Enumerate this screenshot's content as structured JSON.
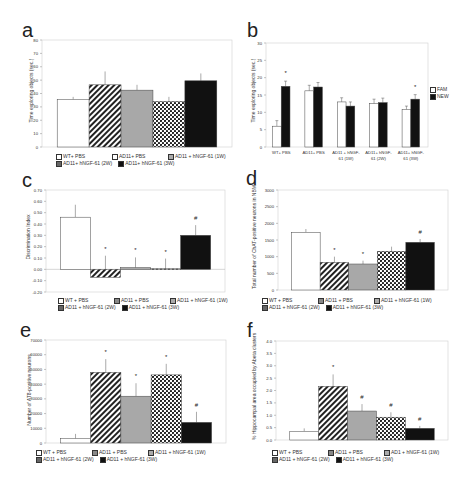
{
  "chart_data": [
    {
      "panel": "a",
      "type": "bar",
      "title": "",
      "xlabel": "",
      "ylabel": "Time exploring objects (sec.)",
      "ylim": [
        0,
        80
      ],
      "yticks": [
        "0",
        "10",
        "20",
        "30",
        "40",
        "50",
        "60",
        "70",
        "80"
      ],
      "categories": [
        "WT+ PBS",
        "AD11+ PBS",
        "AD11 + hNGF-61 (1W)",
        "AD11+ hNGF-61 (2W)",
        "AD11+ hNGF-61 (3W)"
      ],
      "values": [
        35.5,
        46.5,
        42.5,
        34,
        49.5
      ],
      "errors": [
        2,
        10,
        4,
        3.5,
        5.5
      ],
      "annotations": [
        "",
        "",
        "",
        "",
        ""
      ],
      "legend": [
        "WT+ PBS",
        "AD11+ PBS",
        "AD11 + hNGF-61 (1W)",
        "AD11+ hNGF-61 (2W)",
        "AD11+ hNGF-61 (3W)"
      ],
      "legend_position": "bottom",
      "grid": false
    },
    {
      "panel": "b",
      "type": "bar",
      "title": "",
      "xlabel": "",
      "ylabel": "Time exploring objects (sec.)",
      "ylim": [
        0,
        30
      ],
      "yticks": [
        "0",
        "5",
        "10",
        "15",
        "20",
        "25",
        "30"
      ],
      "categories": [
        "WT+ PBS",
        "AD11+ PBS",
        "AD11 + hNGF-61 (1W)",
        "AD11+ hNGF-61 (2W)",
        "AD11+ hNGF-61 (3W)"
      ],
      "category_lines": [
        [
          "WT+ PBS"
        ],
        [
          "AD11+ PBS"
        ],
        [
          "AD11 + hNGF-",
          "61 (1W)"
        ],
        [
          "AD11+ hNGF-",
          "61 (2W)"
        ],
        [
          "AD11+ hNGF-",
          "61 (3W)"
        ]
      ],
      "series": [
        {
          "name": "FAM",
          "values": [
            6,
            16.2,
            13,
            12.5,
            10.8
          ],
          "errors": [
            1.6,
            1.6,
            1.2,
            1.3,
            1
          ],
          "color": "#ffffff"
        },
        {
          "name": "NEW",
          "values": [
            17.5,
            17.3,
            11.8,
            12.8,
            13.8
          ],
          "errors": [
            1.5,
            1.3,
            1.2,
            1.3,
            1.3
          ],
          "color": "#111111"
        }
      ],
      "annotations": [
        {
          "category": 0,
          "series": "NEW",
          "text": "*"
        },
        {
          "category": 4,
          "series": "NEW",
          "text": "*"
        }
      ],
      "legend": [
        "FAM",
        "NEW"
      ],
      "legend_position": "right",
      "grid": false
    },
    {
      "panel": "c",
      "type": "bar",
      "title": "",
      "xlabel": "",
      "ylabel": "Discrimination Index",
      "ylim": [
        -0.2,
        0.7
      ],
      "yticks": [
        "-0.20",
        "-0.10",
        "0.00",
        "0.10",
        "0.20",
        "0.30",
        "0.40",
        "0.50",
        "0.60",
        "0.70"
      ],
      "categories": [
        "WT + PBS",
        "AD11 + PBS",
        "AD11 + hNGF-61 (1W)",
        "AD11 + hNGF-61 (2W)",
        "AD11 + hNGF-61 (3W)"
      ],
      "values": [
        0.46,
        -0.07,
        0.015,
        0.005,
        0.3
      ],
      "errors": [
        0.11,
        0.12,
        0.09,
        0.09,
        0.09
      ],
      "annotations": [
        "",
        "*",
        "*",
        "*",
        "#"
      ],
      "legend": [
        "WT + PBS",
        "AD11 + PBS",
        "AD11 + hNGF-61 (1W)",
        "AD11 + hNGF-61 (2W)",
        "AD11 + hNGF-61 (3W)"
      ],
      "legend_position": "bottom",
      "grid": false
    },
    {
      "panel": "d",
      "type": "bar",
      "title": "",
      "xlabel": "",
      "ylabel": "Total number of ChAT-positive neurons in NBM",
      "ylim": [
        0,
        3000
      ],
      "yticks": [
        "0",
        "500",
        "1000",
        "1500",
        "2000",
        "2500",
        "3000"
      ],
      "categories": [
        "WT + PBS",
        "AD11 + PBS",
        "AD11 + hNGF-61 (1W)",
        "AD11 + hNGF-61 (2W)",
        "AD11 + hNGF-61 (3W)"
      ],
      "values": [
        1730,
        830,
        780,
        1160,
        1430
      ],
      "errors": [
        100,
        170,
        100,
        140,
        100
      ],
      "annotations": [
        "",
        "*",
        "*",
        "",
        "#"
      ],
      "legend": [
        "WT + PBS",
        "AD11 + PBS",
        "AD11 + hNGF-61 (1W)",
        "AD11 + hNGF-61 (2W)",
        "AD11 + hNGF-61 (3W)"
      ],
      "legend_position": "bottom",
      "grid": false
    },
    {
      "panel": "e",
      "type": "bar",
      "title": "",
      "xlabel": "",
      "ylabel": "Number of AT8-positive neurons",
      "ylim": [
        0,
        70000
      ],
      "yticks": [
        "0",
        "10000",
        "20000",
        "30000",
        "40000",
        "50000",
        "60000",
        "70000"
      ],
      "categories": [
        "WT + PBS",
        "AD11 + PBS",
        "AD11 + hNGF-61 (1W)",
        "AD11 + hNGF-61 (2W)",
        "AD11 + hNGF-61 (3W)"
      ],
      "values": [
        3000,
        48000,
        31800,
        46300,
        14000
      ],
      "errors": [
        3200,
        9000,
        8800,
        7500,
        7200
      ],
      "annotations": [
        "",
        "*",
        "*",
        "*",
        "#"
      ],
      "legend": [
        "WT + PBS",
        "AD11 + PBS",
        "AD11 + hNGF-61 (1W)",
        "AD11 + hNGF-61 (2W)",
        "AD11 + hNGF-61 (3W)"
      ],
      "legend_position": "bottom",
      "grid": false
    },
    {
      "panel": "f",
      "type": "bar",
      "title": "",
      "xlabel": "",
      "ylabel": "% Hippocampal area occupied by Abeta clusters",
      "ylim": [
        0,
        4.0
      ],
      "yticks": [
        "0.0",
        "0.5",
        "1.0",
        "1.5",
        "2.0",
        "2.5",
        "3.0",
        "3.5",
        "4.0"
      ],
      "categories": [
        "WT + PBS",
        "AD11 + PBS",
        "AD1 + hNGF-61 (1W)",
        "AD11 + hNGF-61 (2W)",
        "AD11 + hNGF-61 (3W)"
      ],
      "values": [
        0.35,
        2.17,
        1.17,
        0.92,
        0.47
      ],
      "errors": [
        0.12,
        0.48,
        0.28,
        0.2,
        0.1
      ],
      "annotations": [
        "",
        "*",
        "#",
        "#",
        "#"
      ],
      "legend": [
        "WT + PBS",
        "AD11 + PBS",
        "AD1 + hNGF-61 (1W)",
        "AD11 + hNGF-61 (2W)",
        "AD11 + hNGF-61 (3W)"
      ],
      "legend_position": "bottom",
      "grid": false
    }
  ],
  "panels": {
    "a": {
      "label": "a",
      "ylabel": "Time exploring objects (sec.)",
      "legend": [
        "WT+ PBS",
        "AD11+ PBS",
        "AD11 + hNGF-61 (1W)",
        "AD11+ hNGF-61 (2W)",
        "AD11+ hNGF-61 (3W)"
      ]
    },
    "b": {
      "label": "b",
      "ylabel": "Time exploring objects (sec.)",
      "legend": [
        "FAM",
        "NEW"
      ]
    },
    "c": {
      "label": "c",
      "ylabel": "Discrimination Index",
      "legend": [
        "WT + PBS",
        "AD11 + PBS",
        "AD11 + hNGF-61 (1W)",
        "AD11 + hNGF-61 (2W)",
        "AD11 + hNGF-61 (3W)"
      ]
    },
    "d": {
      "label": "d",
      "ylabel": "Total number of ChAT-positive neurons in NBM",
      "legend": [
        "WT + PBS",
        "AD11 + PBS",
        "AD11 + hNGF-61 (1W)",
        "AD11 + hNGF-61 (2W)",
        "AD11 + hNGF-61 (3W)"
      ]
    },
    "e": {
      "label": "e",
      "ylabel": "Number of AT8-positive neurons",
      "legend": [
        "WT + PBS",
        "AD11 + PBS",
        "AD11 + hNGF-61 (1W)",
        "AD11 + hNGF-61 (2W)",
        "AD11 + hNGF-61 (3W)"
      ]
    },
    "f": {
      "label": "f",
      "ylabel": "% Hippocampal area occupied by Abeta clusters",
      "legend": [
        "WT + PBS",
        "AD11 + PBS",
        "AD1 + hNGF-61 (1W)",
        "AD11 + hNGF-61 (2W)",
        "AD11 + hNGF-61 (3W)"
      ]
    }
  },
  "colors": {
    "axis": "#bbbbbb",
    "bar_outline": "#444444",
    "white": "#ffffff",
    "gray": "#a8a8a8",
    "black": "#111111"
  }
}
